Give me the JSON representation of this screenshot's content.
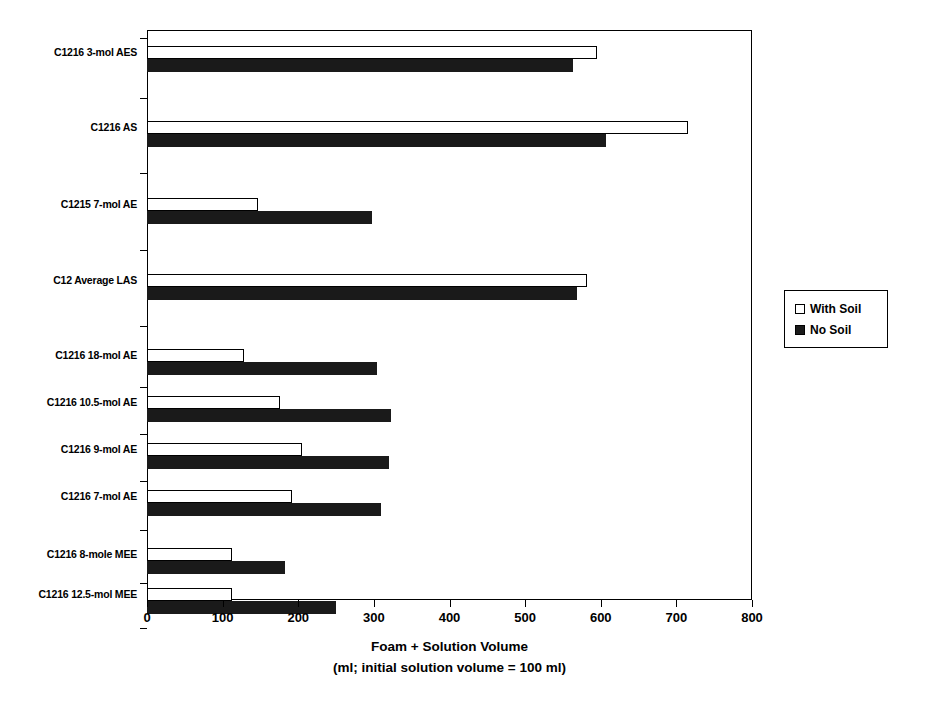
{
  "chart_data": {
    "type": "bar",
    "orientation": "horizontal",
    "title": "",
    "xlabel_line1": "Foam + Solution Volume",
    "xlabel_line2": "(ml; initial solution volume = 100 ml)",
    "ylabel": "",
    "xlim": [
      0,
      800
    ],
    "xticks": [
      0,
      100,
      200,
      300,
      400,
      500,
      600,
      700,
      800
    ],
    "xtick_labels": [
      "0",
      "100",
      "200",
      "300",
      "400",
      "500",
      "600",
      "700",
      "800"
    ],
    "grid": false,
    "legend_position": "right-outside",
    "categories": [
      "C1216 3-mol AES",
      "C1216 AS",
      "C1215 7-mol AE",
      "C12 Average LAS",
      "C1216 18-mol AE",
      "C1216 10.5-mol AE",
      "C1216 9-mol AE",
      "C1216 7-mol AE",
      "C1216 8-mole MEE",
      "C1216 12.5-mol MEE"
    ],
    "series": [
      {
        "name": "With Soil",
        "fill": "#ffffff",
        "edge": "#000000",
        "values": [
          595,
          715,
          147,
          582,
          128,
          176,
          205,
          192,
          112,
          112
        ]
      },
      {
        "name": "No Soil",
        "fill": "#1a1a1a",
        "edge": "#000000",
        "values": [
          563,
          607,
          298,
          568,
          304,
          322,
          320,
          310,
          182,
          250
        ]
      }
    ]
  },
  "legend": {
    "entries": [
      {
        "label": "With Soil",
        "style": "open"
      },
      {
        "label": "No Soil",
        "style": "filled"
      }
    ]
  },
  "colors": {
    "axis": "#000000",
    "background": "#ffffff",
    "with_soil": "#ffffff",
    "no_soil": "#1a1a1a"
  }
}
